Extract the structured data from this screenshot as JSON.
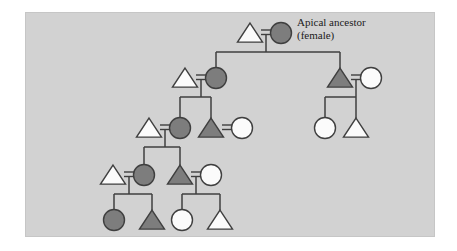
{
  "figure": {
    "panel": {
      "background_color": "#d2d2d2",
      "page_color": "#ffffff"
    },
    "legend": {
      "dark_fill": "#7d7d7d",
      "light_fill": "#fbfbfb",
      "line_color": "#3f3f3f",
      "dark_meaning": "lineage member",
      "light_meaning": "non-member (married in)"
    }
  },
  "annotations": [
    {
      "name": "apical-ancestor-label",
      "line1": "Apical ancestor",
      "line2": "(female)",
      "x": 297,
      "y": 26
    }
  ],
  "chart_data": {
    "type": "diagram",
    "diagram_kind": "kinship-pedigree",
    "symbol_key": {
      "triangle": "male",
      "circle": "female",
      "dark": "lineage member",
      "light": "non-member",
      "equals": "marriage / union",
      "vertical_line": "descent"
    },
    "generations": 5,
    "nodes": [
      {
        "id": "g1-husband",
        "shape": "triangle",
        "fill": "light",
        "sex": "male",
        "cx": 250,
        "cy": 33,
        "gen": 1
      },
      {
        "id": "g1-apical",
        "shape": "circle",
        "fill": "dark",
        "sex": "female",
        "cx": 281,
        "cy": 33,
        "gen": 1,
        "label": "Apical ancestor (female)"
      },
      {
        "id": "g2a-husband",
        "shape": "triangle",
        "fill": "light",
        "sex": "male",
        "cx": 185,
        "cy": 78,
        "gen": 2
      },
      {
        "id": "g2a-wife",
        "shape": "circle",
        "fill": "dark",
        "sex": "female",
        "cx": 216,
        "cy": 78,
        "gen": 2
      },
      {
        "id": "g2b-son",
        "shape": "triangle",
        "fill": "dark",
        "sex": "male",
        "cx": 340,
        "cy": 78,
        "gen": 2
      },
      {
        "id": "g2b-wife",
        "shape": "circle",
        "fill": "light",
        "sex": "female",
        "cx": 371,
        "cy": 78,
        "gen": 2
      },
      {
        "id": "g3r-daughter",
        "shape": "circle",
        "fill": "light",
        "sex": "female",
        "cx": 325,
        "cy": 128,
        "gen": 3
      },
      {
        "id": "g3r-son",
        "shape": "triangle",
        "fill": "light",
        "sex": "male",
        "cx": 356,
        "cy": 128,
        "gen": 3
      },
      {
        "id": "g3a-husband",
        "shape": "triangle",
        "fill": "light",
        "sex": "male",
        "cx": 149,
        "cy": 128,
        "gen": 3
      },
      {
        "id": "g3a-wife",
        "shape": "circle",
        "fill": "dark",
        "sex": "female",
        "cx": 180,
        "cy": 128,
        "gen": 3
      },
      {
        "id": "g3b-son",
        "shape": "triangle",
        "fill": "dark",
        "sex": "male",
        "cx": 211,
        "cy": 128,
        "gen": 3
      },
      {
        "id": "g3b-wife",
        "shape": "circle",
        "fill": "light",
        "sex": "female",
        "cx": 242,
        "cy": 128,
        "gen": 3
      },
      {
        "id": "g4a-husband",
        "shape": "triangle",
        "fill": "light",
        "sex": "male",
        "cx": 113,
        "cy": 175,
        "gen": 4
      },
      {
        "id": "g4a-wife",
        "shape": "circle",
        "fill": "dark",
        "sex": "female",
        "cx": 144,
        "cy": 175,
        "gen": 4
      },
      {
        "id": "g4b-son",
        "shape": "triangle",
        "fill": "dark",
        "sex": "male",
        "cx": 180,
        "cy": 175,
        "gen": 4
      },
      {
        "id": "g4b-wife",
        "shape": "circle",
        "fill": "light",
        "sex": "female",
        "cx": 211,
        "cy": 175,
        "gen": 4
      },
      {
        "id": "g5a-daughter",
        "shape": "circle",
        "fill": "dark",
        "sex": "female",
        "cx": 114,
        "cy": 220,
        "gen": 5
      },
      {
        "id": "g5a-son",
        "shape": "triangle",
        "fill": "dark",
        "sex": "male",
        "cx": 152,
        "cy": 220,
        "gen": 5
      },
      {
        "id": "g5b-daughter",
        "shape": "circle",
        "fill": "light",
        "sex": "female",
        "cx": 182,
        "cy": 220,
        "gen": 5
      },
      {
        "id": "g5b-son",
        "shape": "triangle",
        "fill": "light",
        "sex": "male",
        "cx": 220,
        "cy": 220,
        "gen": 5
      }
    ],
    "unions": [
      {
        "id": "union-g1",
        "left": "g1-husband",
        "right": "g1-apical",
        "x": 266,
        "y": 33,
        "children": [
          "g2a-wife",
          "g2b-son"
        ]
      },
      {
        "id": "union-g2a",
        "left": "g2a-husband",
        "right": "g2a-wife",
        "x": 201,
        "y": 78,
        "children": [
          "g3a-wife",
          "g3b-son"
        ]
      },
      {
        "id": "union-g2b",
        "left": "g2b-son",
        "right": "g2b-wife",
        "x": 356,
        "y": 78,
        "children": [
          "g3r-daughter",
          "g3r-son"
        ]
      },
      {
        "id": "union-g3a",
        "left": "g3a-husband",
        "right": "g3a-wife",
        "x": 165,
        "y": 128,
        "children": [
          "g4a-wife",
          "g4b-son"
        ]
      },
      {
        "id": "union-g3b",
        "left": "g3b-son",
        "right": "g3b-wife",
        "x": 227,
        "y": 128,
        "children": []
      },
      {
        "id": "union-g4a",
        "left": "g4a-husband",
        "right": "g4a-wife",
        "x": 129,
        "y": 175,
        "children": [
          "g5a-daughter",
          "g5a-son"
        ]
      },
      {
        "id": "union-g4b",
        "left": "g4b-son",
        "right": "g4b-wife",
        "x": 196,
        "y": 175,
        "children": [
          "g5b-daughter",
          "g5b-son"
        ]
      }
    ]
  }
}
